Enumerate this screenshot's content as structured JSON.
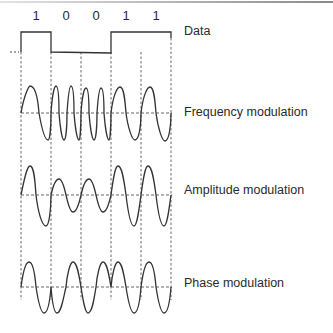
{
  "figure": {
    "bits": [
      "1",
      "0",
      "0",
      "1",
      "1"
    ],
    "labels": {
      "data": "Data",
      "fm": "Frequency modulation",
      "am": "Amplitude modulation",
      "pm": "Phase modulation"
    },
    "colors": {
      "line": "#333333",
      "dashed": "#555555",
      "text": "#2a2a2a"
    }
  }
}
